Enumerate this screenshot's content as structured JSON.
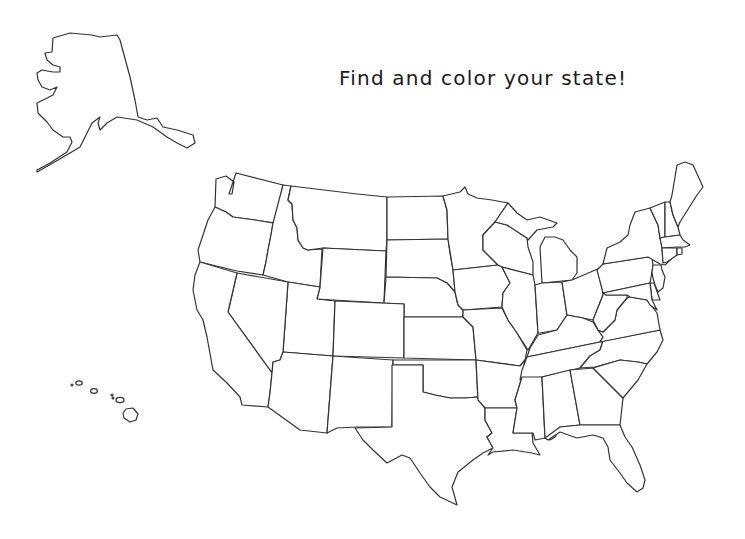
{
  "page": {
    "background": "#ffffff"
  },
  "title": {
    "text": "Find and color your state!",
    "color": "#1a1a1a"
  },
  "map": {
    "stroke_color": "#333333",
    "fill_color": "#ffffff",
    "regions": [
      "alaska",
      "hawaii",
      "contiguous-united-states"
    ]
  }
}
